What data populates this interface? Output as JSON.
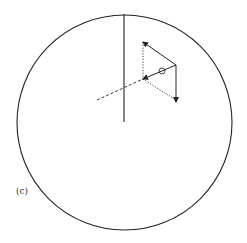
{
  "figure": {
    "panel_label": "(c)",
    "stroke_color": "#222222",
    "circle": {
      "cx": 124.5,
      "cy": 122.5,
      "r": 107.5
    },
    "vertical_axis": {
      "x1": 124,
      "y1": 14,
      "x2": 124,
      "y2": 122
    },
    "dashed_axis": {
      "x1": 97,
      "y1": 100,
      "x2": 143,
      "y2": 79
    },
    "vectors": [
      {
        "name": "upper-left-vector",
        "x1": 176,
        "y1": 65,
        "x2": 143,
        "y2": 42
      },
      {
        "name": "downward-vector",
        "x1": 176,
        "y1": 65,
        "x2": 176,
        "y2": 102
      },
      {
        "name": "inward-vector",
        "x1": 176,
        "y1": 65,
        "x2": 143,
        "y2": 79
      }
    ],
    "dotted_guides": [
      {
        "x1": 143,
        "y1": 42,
        "x2": 143,
        "y2": 79
      },
      {
        "x1": 143,
        "y1": 79,
        "x2": 176,
        "y2": 100
      }
    ],
    "small_circle": {
      "cx": 162,
      "cy": 71,
      "r": 3
    }
  }
}
